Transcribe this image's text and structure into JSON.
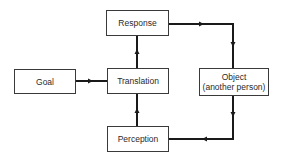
{
  "diagram": {
    "type": "block-flow",
    "nodes": [
      {
        "id": "goal",
        "label": "Goal"
      },
      {
        "id": "response",
        "label": "Response"
      },
      {
        "id": "translation",
        "label": "Translation"
      },
      {
        "id": "perception",
        "label": "Perception"
      },
      {
        "id": "object",
        "label_line1": "Object",
        "label_line2": "(another person)"
      }
    ],
    "edges": [
      {
        "from": "goal",
        "to": "translation"
      },
      {
        "from": "translation",
        "to": "response"
      },
      {
        "from": "response",
        "to": "object"
      },
      {
        "from": "object",
        "to": "perception"
      },
      {
        "from": "perception",
        "to": "translation"
      }
    ],
    "colors": {
      "line": "#1a1a1a",
      "box_border": "#3a3a3a",
      "text": "#2a2a2a"
    }
  }
}
